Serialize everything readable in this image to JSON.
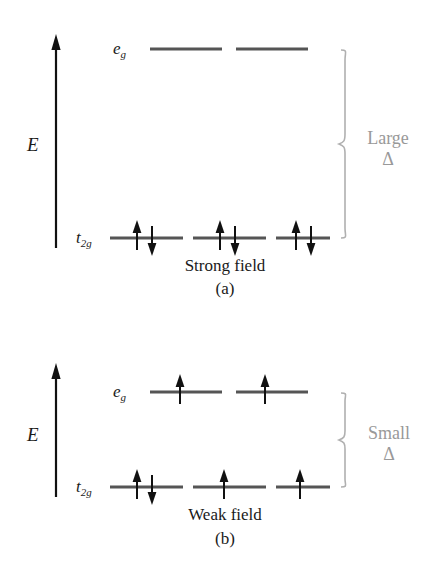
{
  "figure": {
    "background_color": "#ffffff",
    "line_color": "#555555",
    "arrow_color": "#111111",
    "brace_color": "#b0b0b0",
    "delta_text_color": "#999999"
  },
  "panels": [
    {
      "id": "a",
      "axis_label": "E",
      "levels": [
        {
          "name": "eg",
          "label_text": "e",
          "label_sub": "g",
          "orbitals": [
            {
              "electrons": []
            },
            {
              "electrons": []
            }
          ]
        },
        {
          "name": "t2g",
          "label_text": "t",
          "label_sub": "2g",
          "orbitals": [
            {
              "electrons": [
                "up",
                "down"
              ]
            },
            {
              "electrons": [
                "up",
                "down"
              ]
            },
            {
              "electrons": [
                "up",
                "down"
              ]
            }
          ]
        }
      ],
      "splitting": {
        "size_label": "Large",
        "symbol": "Δ"
      },
      "caption": "Strong field",
      "subcaption": "(a)"
    },
    {
      "id": "b",
      "axis_label": "E",
      "levels": [
        {
          "name": "eg",
          "label_text": "e",
          "label_sub": "g",
          "orbitals": [
            {
              "electrons": [
                "up"
              ]
            },
            {
              "electrons": [
                "up"
              ]
            }
          ]
        },
        {
          "name": "t2g",
          "label_text": "t",
          "label_sub": "2g",
          "orbitals": [
            {
              "electrons": [
                "up",
                "down"
              ]
            },
            {
              "electrons": [
                "up"
              ]
            },
            {
              "electrons": [
                "up"
              ]
            }
          ]
        }
      ],
      "splitting": {
        "size_label": "Small",
        "symbol": "Δ"
      },
      "caption": "Weak field",
      "subcaption": "(b)"
    }
  ]
}
